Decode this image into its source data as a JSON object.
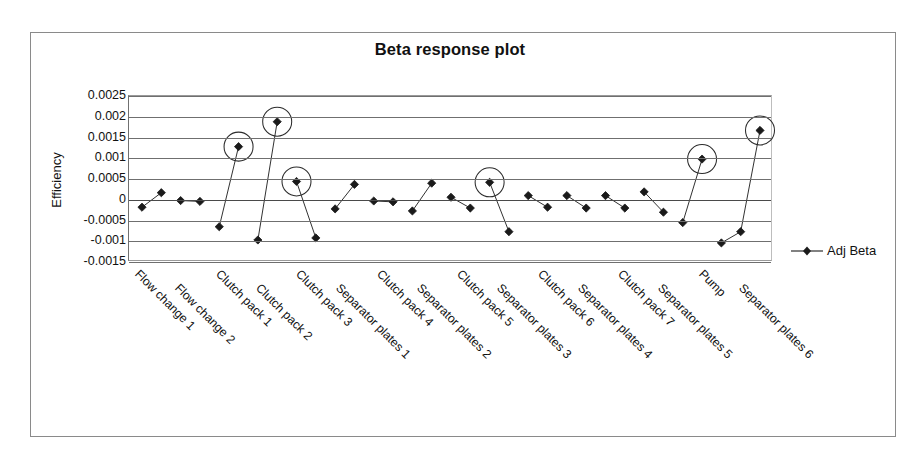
{
  "chart_data": {
    "type": "scatter",
    "title": "Beta response plot",
    "xlabel": "",
    "ylabel": "Efficiency",
    "ylim": [
      -0.0015,
      0.0025
    ],
    "ytick_step": 0.0005,
    "yticks": [
      "0.0025",
      "0.002",
      "0.0015",
      "0.001",
      "0.0005",
      "0",
      "-0.0005",
      "-0.001",
      "-0.0015"
    ],
    "ytick_values": [
      0.0025,
      0.002,
      0.0015,
      0.001,
      0.0005,
      0,
      -0.0005,
      -0.001,
      -0.0015
    ],
    "grid": true,
    "legend": [
      {
        "name": "Adj Beta",
        "marker": "diamond",
        "color": "#1a1a1a"
      }
    ],
    "legend_position": "right",
    "categories": [
      "Flow change 1",
      "Flow change 2",
      "Clutch pack 1",
      "Clutch pack 2",
      "Clutch pack 3",
      "Separator plates 1",
      "Clutch pack 4",
      "Separator plates 2",
      "Clutch pack 5",
      "Separator plates 3",
      "Clutch pack 6",
      "Separator plates 4",
      "Clutch pack 7",
      "Separator plates 5",
      "Pump",
      "Separator plates 6"
    ],
    "series": [
      {
        "name": "Adj Beta",
        "points": [
          {
            "x": 0,
            "label": "Flow change 1 low",
            "value": -0.00018,
            "circled": false
          },
          {
            "x": 1,
            "label": "Flow change 1 high",
            "value": 0.00017,
            "circled": false
          },
          {
            "x": 2,
            "label": "Flow change 2 low",
            "value": -2e-05,
            "circled": false
          },
          {
            "x": 3,
            "label": "Flow change 2 high",
            "value": -4e-05,
            "circled": false
          },
          {
            "x": 4,
            "label": "Clutch pack 1 low",
            "value": -0.00065,
            "circled": false
          },
          {
            "x": 5,
            "label": "Clutch pack 1 high",
            "value": 0.00128,
            "circled": true
          },
          {
            "x": 6,
            "label": "Clutch pack 2 low",
            "value": -0.00097,
            "circled": false
          },
          {
            "x": 7,
            "label": "Clutch pack 2 high",
            "value": 0.00188,
            "circled": true
          },
          {
            "x": 8,
            "label": "Clutch pack 3 high",
            "value": 0.00044,
            "circled": true
          },
          {
            "x": 9,
            "label": "Clutch pack 3 low",
            "value": -0.00092,
            "circled": false
          },
          {
            "x": 10,
            "label": "Separator plates 1 low",
            "value": -0.00022,
            "circled": false
          },
          {
            "x": 11,
            "label": "Separator plates 1 high",
            "value": 0.00037,
            "circled": false
          },
          {
            "x": 12,
            "label": "Clutch pack 4 low",
            "value": -3e-05,
            "circled": false
          },
          {
            "x": 13,
            "label": "Clutch pack 4 high",
            "value": -5e-05,
            "circled": false
          },
          {
            "x": 14,
            "label": "Separator plates 2 low",
            "value": -0.00027,
            "circled": false
          },
          {
            "x": 15,
            "label": "Separator plates 2 high",
            "value": 0.0004,
            "circled": false
          },
          {
            "x": 16,
            "label": "Clutch pack 5 high",
            "value": 6e-05,
            "circled": false
          },
          {
            "x": 17,
            "label": "Clutch pack 5 low",
            "value": -0.0002,
            "circled": false
          },
          {
            "x": 18,
            "label": "Separator plates 3 high",
            "value": 0.00042,
            "circled": true
          },
          {
            "x": 19,
            "label": "Separator plates 3 low",
            "value": -0.00077,
            "circled": false
          },
          {
            "x": 20,
            "label": "Clutch pack 6 high",
            "value": 0.0001,
            "circled": false
          },
          {
            "x": 21,
            "label": "Clutch pack 6 low",
            "value": -0.00018,
            "circled": false
          },
          {
            "x": 22,
            "label": "Separator plates 4 high",
            "value": 0.0001,
            "circled": false
          },
          {
            "x": 23,
            "label": "Separator plates 4 low",
            "value": -0.0002,
            "circled": false
          },
          {
            "x": 24,
            "label": "Clutch pack 7 high",
            "value": 0.0001,
            "circled": false
          },
          {
            "x": 25,
            "label": "Clutch pack 7 low",
            "value": -0.0002,
            "circled": false
          },
          {
            "x": 26,
            "label": "Separator plates 5 high",
            "value": 0.00019,
            "circled": false
          },
          {
            "x": 27,
            "label": "Separator plates 5 low",
            "value": -0.0003,
            "circled": false
          },
          {
            "x": 28,
            "label": "Pump low",
            "value": -0.00055,
            "circled": false
          },
          {
            "x": 29,
            "label": "Pump high",
            "value": 0.00098,
            "circled": true
          },
          {
            "x": 30,
            "label": "Separator plates 6 low",
            "value": -0.00104,
            "circled": false
          },
          {
            "x": 31,
            "label": "Separator plates 6 mid",
            "value": -0.00077,
            "circled": false
          },
          {
            "x": 32,
            "label": "Separator plates 6 high",
            "value": 0.00167,
            "circled": true
          }
        ],
        "segments": [
          [
            0,
            1
          ],
          [
            2,
            3
          ],
          [
            4,
            5
          ],
          [
            6,
            7
          ],
          [
            8,
            9
          ],
          [
            10,
            11
          ],
          [
            12,
            13
          ],
          [
            14,
            15
          ],
          [
            16,
            17
          ],
          [
            18,
            19
          ],
          [
            20,
            21
          ],
          [
            22,
            23
          ],
          [
            24,
            25
          ],
          [
            26,
            27
          ],
          [
            28,
            29
          ],
          [
            30,
            31
          ],
          [
            31,
            32
          ]
        ],
        "circled_indices": [
          5,
          7,
          8,
          18,
          29,
          32
        ]
      }
    ]
  }
}
